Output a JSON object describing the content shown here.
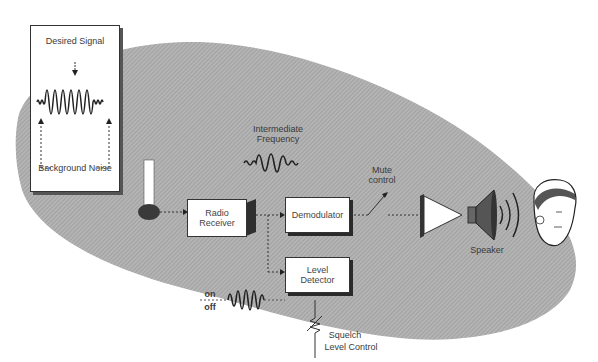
{
  "diagram": {
    "inset": {
      "top_label": "Desired Signal",
      "bottom_label": "Background Noise"
    },
    "labels": {
      "intermediate_frequency": "Intermediate Frequency",
      "mute_control": "Mute control",
      "speaker": "Speaker",
      "on": "on",
      "off": "off",
      "squelch": "Squelch",
      "level_control": "Level Control"
    },
    "blocks": {
      "radio_receiver": "Radio Receiver",
      "demodulator": "Demodulator",
      "level_detector": "Level Detector"
    },
    "colors": {
      "ellipse": "#a9a9a9",
      "line": "#333333",
      "box": "#ffffff"
    }
  }
}
